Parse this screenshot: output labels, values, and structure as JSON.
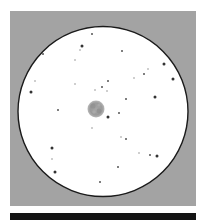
{
  "image": {
    "subject": "eyepiece sketch of a nebula in a star field",
    "colors": {
      "frame_background": "#a3a3a3",
      "field_of_view": "#ffffff",
      "field_outline": "#1a1a1a",
      "nebula": "#9a9a9a",
      "nebula_dark": "#858585",
      "star": "#3a3a3a",
      "scale_bar": "#141414"
    }
  },
  "nebula": {
    "label": "nebula",
    "brightness": "diffuse mottled disc"
  },
  "stars": [
    {
      "x": 92,
      "y": 34,
      "mag": "small"
    },
    {
      "x": 82,
      "y": 46,
      "mag": "medium"
    },
    {
      "x": 80,
      "y": 50,
      "mag": "faint"
    },
    {
      "x": 43,
      "y": 54,
      "mag": "small"
    },
    {
      "x": 75,
      "y": 60,
      "mag": "faint"
    },
    {
      "x": 35,
      "y": 81,
      "mag": "faint"
    },
    {
      "x": 31,
      "y": 92,
      "mag": "medium"
    },
    {
      "x": 75,
      "y": 84,
      "mag": "faint"
    },
    {
      "x": 122,
      "y": 51,
      "mag": "small"
    },
    {
      "x": 164,
      "y": 64,
      "mag": "medium"
    },
    {
      "x": 148,
      "y": 69,
      "mag": "faint"
    },
    {
      "x": 144,
      "y": 74,
      "mag": "small"
    },
    {
      "x": 134,
      "y": 78,
      "mag": "faint"
    },
    {
      "x": 173,
      "y": 79,
      "mag": "medium"
    },
    {
      "x": 108,
      "y": 81,
      "mag": "small"
    },
    {
      "x": 102,
      "y": 87,
      "mag": "small"
    },
    {
      "x": 95,
      "y": 90,
      "mag": "faint"
    },
    {
      "x": 107,
      "y": 91,
      "mag": "faint"
    },
    {
      "x": 155,
      "y": 97,
      "mag": "medium"
    },
    {
      "x": 126,
      "y": 99,
      "mag": "small"
    },
    {
      "x": 58,
      "y": 110,
      "mag": "small"
    },
    {
      "x": 119,
      "y": 113,
      "mag": "small"
    },
    {
      "x": 108,
      "y": 117,
      "mag": "medium"
    },
    {
      "x": 92,
      "y": 128,
      "mag": "faint"
    },
    {
      "x": 121,
      "y": 137,
      "mag": "faint"
    },
    {
      "x": 126,
      "y": 139,
      "mag": "small"
    },
    {
      "x": 52,
      "y": 148,
      "mag": "medium"
    },
    {
      "x": 139,
      "y": 153,
      "mag": "faint"
    },
    {
      "x": 150,
      "y": 155,
      "mag": "small"
    },
    {
      "x": 157,
      "y": 156,
      "mag": "medium"
    },
    {
      "x": 52,
      "y": 159,
      "mag": "faint"
    },
    {
      "x": 118,
      "y": 167,
      "mag": "small"
    },
    {
      "x": 55,
      "y": 172,
      "mag": "medium"
    },
    {
      "x": 100,
      "y": 182,
      "mag": "small"
    }
  ]
}
